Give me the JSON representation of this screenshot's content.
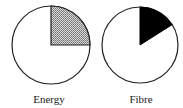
{
  "chart_data": [
    {
      "type": "pie",
      "title": "Energy",
      "slices": [
        {
          "label": "highlighted",
          "value": 25,
          "fill": "hatched-gray"
        },
        {
          "label": "remainder",
          "value": 75,
          "fill": "#ffffff"
        }
      ],
      "start_angle": "12 o'clock",
      "direction": "clockwise"
    },
    {
      "type": "pie",
      "title": "Fibre",
      "slices": [
        {
          "label": "highlighted",
          "value": 16,
          "fill": "#000000"
        },
        {
          "label": "remainder",
          "value": 84,
          "fill": "#ffffff"
        }
      ],
      "start_angle": "12 o'clock",
      "direction": "clockwise"
    }
  ],
  "charts": {
    "energy": {
      "label": "Energy",
      "fraction": 0.25,
      "fill": "#aaaaaa",
      "outline": "#222222"
    },
    "fibre": {
      "label": "Fibre",
      "fraction": 0.16,
      "fill": "#000000",
      "outline": "#222222"
    }
  }
}
